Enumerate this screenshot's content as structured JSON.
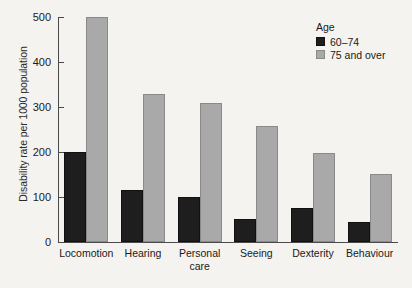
{
  "chart_data": {
    "type": "bar",
    "title": "",
    "xlabel": "",
    "ylabel": "Disability rate per 1000 population",
    "ylim": [
      0,
      500
    ],
    "yticks": [
      0,
      100,
      200,
      300,
      400,
      500
    ],
    "ytick_labels": [
      "0",
      "100",
      "200",
      "300",
      "400",
      "500"
    ],
    "grid": false,
    "legend_position": "top-right",
    "legend_title": "Age",
    "categories": [
      "Locomotion",
      "Hearing",
      "Personal\ncare",
      "Seeing",
      "Dexterity",
      "Behaviour"
    ],
    "series": [
      {
        "name": "60–74",
        "color": "#1e1e1e",
        "values": [
          200,
          115,
          100,
          52,
          75,
          45
        ]
      },
      {
        "name": "75 and over",
        "color": "#a9a9a9",
        "values": [
          500,
          330,
          310,
          257,
          198,
          152
        ]
      }
    ]
  }
}
